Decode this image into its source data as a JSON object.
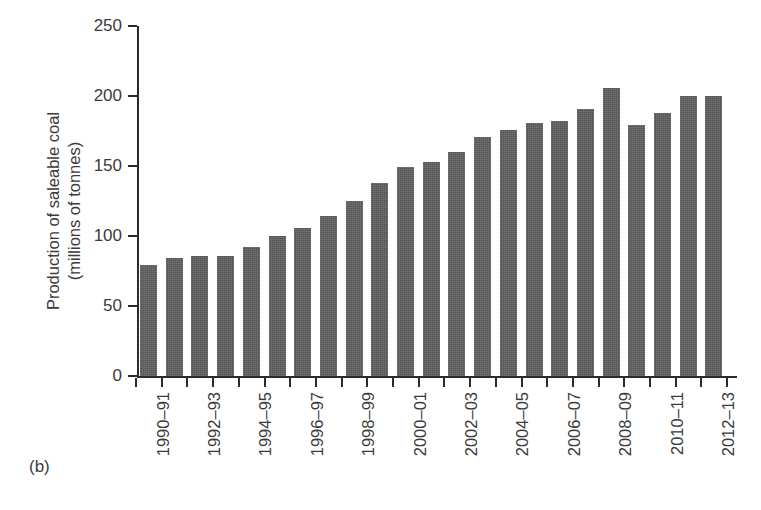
{
  "figure": {
    "panel_label": "(b)"
  },
  "chart_data": {
    "type": "bar",
    "title": "",
    "xlabel": "",
    "ylabel": "Production of saleable coal (millions of tonnes)",
    "ylabel_lines": [
      "Production of saleable coal",
      "(millions of tonnes)"
    ],
    "ylim": [
      0,
      250
    ],
    "ytick_values": [
      0,
      50,
      100,
      150,
      200,
      250
    ],
    "ytick_labels": [
      "0",
      "50",
      "100",
      "150",
      "200",
      "250"
    ],
    "grid": false,
    "legend": null,
    "bar_color": "#5d5d5d",
    "axis_color": "#2b2b2b",
    "categories": [
      "1990–91",
      "1991–92",
      "1992–93",
      "1993–94",
      "1994–95",
      "1995–96",
      "1996–97",
      "1997–98",
      "1998–99",
      "1999–2000",
      "2000–01",
      "2001–02",
      "2002–03",
      "2003–04",
      "2004–05",
      "2005–06",
      "2006–07",
      "2007–08",
      "2008–09",
      "2009–10",
      "2010–11",
      "2011–12",
      "2012–13"
    ],
    "xtick_labels_shown": [
      "1990–91",
      "1992–93",
      "1994–95",
      "1996–97",
      "1998–99",
      "2000–01",
      "2002–03",
      "2004–05",
      "2006–07",
      "2008–09",
      "2010–11",
      "2012–13"
    ],
    "values": [
      79,
      84,
      86,
      86,
      92,
      100,
      106,
      114,
      125,
      138,
      149,
      153,
      160,
      171,
      176,
      181,
      182,
      191,
      206,
      179,
      188,
      200,
      200
    ]
  }
}
